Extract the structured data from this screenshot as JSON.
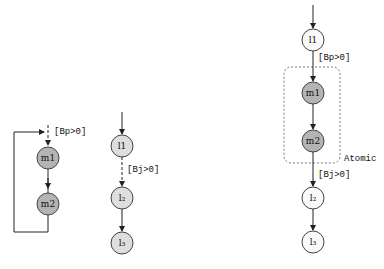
{
  "diagram": {
    "left": {
      "nodes": [
        {
          "id": "m1",
          "label": "m1",
          "style": "gray"
        },
        {
          "id": "m2",
          "label": "m2",
          "style": "gray"
        }
      ],
      "guard": "[Bp>0]"
    },
    "middle": {
      "nodes": [
        {
          "id": "l1",
          "label": "l1",
          "style": "light"
        },
        {
          "id": "l2",
          "label": "l₂",
          "style": "light"
        },
        {
          "id": "l3",
          "label": "l₃",
          "style": "light"
        }
      ],
      "guard": "[Bj>0]"
    },
    "right": {
      "nodes": [
        {
          "id": "l1",
          "label": "l1",
          "style": "white"
        },
        {
          "id": "m1",
          "label": "m1",
          "style": "gray"
        },
        {
          "id": "m2",
          "label": "m2",
          "style": "gray"
        },
        {
          "id": "l2",
          "label": "l₂",
          "style": "white"
        },
        {
          "id": "l3",
          "label": "l₃",
          "style": "white"
        }
      ],
      "guard_top": "[Bp>0]",
      "guard_bottom": "[Bj>0]",
      "group_label": "Atomic"
    },
    "colors": {
      "gray_fill": "#b4b4b4",
      "light_fill": "#dedede",
      "white_fill": "#fafafa",
      "stroke": "#444444"
    }
  }
}
